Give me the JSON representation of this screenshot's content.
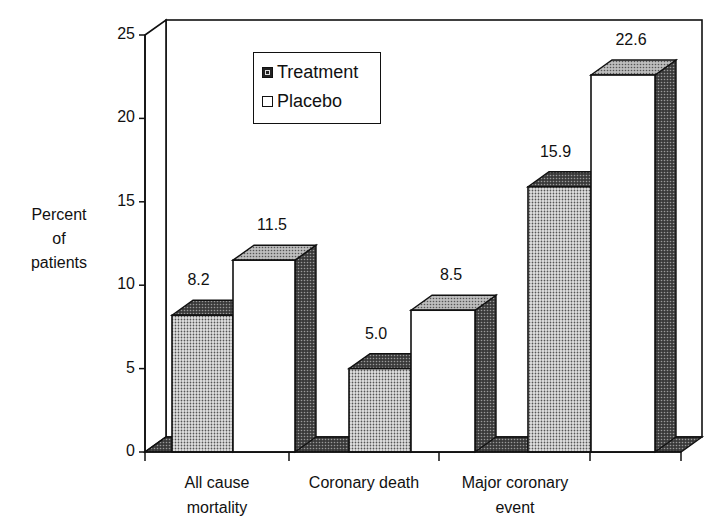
{
  "chart_data": {
    "type": "bar",
    "style": "3d-grouped",
    "title": "",
    "xlabel": "",
    "ylabel": "Percent of patients",
    "ylabel_lines": [
      "Percent",
      "of",
      "patients"
    ],
    "ylim": [
      0,
      25
    ],
    "yticks": [
      0,
      5,
      10,
      15,
      20,
      25
    ],
    "grid": false,
    "legend_position": "top-left inside",
    "categories": [
      "All cause mortality",
      "Coronary death",
      "Major coronary event"
    ],
    "category_lines": [
      [
        "All cause",
        "mortality"
      ],
      [
        "Coronary death"
      ],
      [
        "Major coronary",
        "event"
      ]
    ],
    "series": [
      {
        "name": "Treatment",
        "values": [
          8.2,
          5.0,
          15.9
        ],
        "labels": [
          "8.2",
          "5.0",
          "15.9"
        ],
        "fill": "stippled-gray"
      },
      {
        "name": "Placebo",
        "values": [
          11.5,
          8.5,
          22.6
        ],
        "labels": [
          "11.5",
          "8.5",
          "22.6"
        ],
        "fill": "white"
      }
    ]
  },
  "legend": {
    "items": [
      {
        "label": "Treatment"
      },
      {
        "label": "Placebo"
      }
    ]
  },
  "colors": {
    "ink": "#111111",
    "treatment_front": "#c9c9c9",
    "top": "#9a9a9a",
    "side": "#555555",
    "floor": "#4a4a4a",
    "background": "#ffffff"
  }
}
